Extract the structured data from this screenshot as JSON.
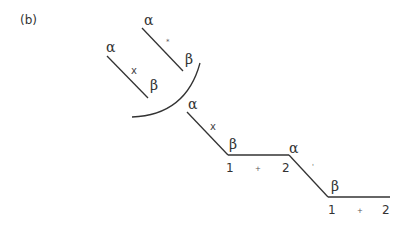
{
  "panel_label": "(b)",
  "fragments": {
    "left_chain": {
      "start": "α",
      "mid": "x",
      "end": "β"
    },
    "upper_chain": {
      "start": "α",
      "mid": "*",
      "end": "β"
    }
  },
  "main_chain": {
    "segment1": {
      "start": "α",
      "mid": "x",
      "end": "β"
    },
    "plateau1": {
      "left": "1",
      "op": "+",
      "right": "2"
    },
    "segment2": {
      "start": "α",
      "mid": "'",
      "end": "β"
    },
    "plateau2": {
      "left": "1",
      "op": "+",
      "right": "2"
    }
  },
  "colors": {
    "line": "#333333",
    "background": "#ffffff"
  }
}
